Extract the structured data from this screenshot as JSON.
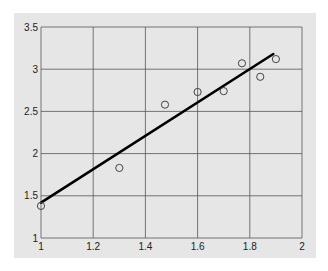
{
  "chart_data": {
    "type": "scatter",
    "title": "",
    "xlabel": "",
    "ylabel": "",
    "xlim": [
      1,
      2
    ],
    "ylim": [
      1,
      3.5
    ],
    "grid": true,
    "legend": null,
    "x_ticks": [
      "1",
      "1.2",
      "1.4",
      "1.6",
      "1.8",
      "2"
    ],
    "y_ticks": [
      "1",
      "1.5",
      "2",
      "2.5",
      "3",
      "3.5"
    ],
    "series": [
      {
        "name": "observations",
        "type": "scatter",
        "marker": "open-circle",
        "points": [
          {
            "x": 1.0,
            "y": 1.38
          },
          {
            "x": 1.3,
            "y": 1.83
          },
          {
            "x": 1.475,
            "y": 2.58
          },
          {
            "x": 1.6,
            "y": 2.73
          },
          {
            "x": 1.7,
            "y": 2.74
          },
          {
            "x": 1.77,
            "y": 3.07
          },
          {
            "x": 1.84,
            "y": 2.91
          },
          {
            "x": 1.9,
            "y": 3.12
          }
        ]
      },
      {
        "name": "fit-line",
        "type": "line",
        "points": [
          {
            "x": 1.0,
            "y": 1.42
          },
          {
            "x": 1.89,
            "y": 3.18
          }
        ]
      }
    ],
    "colors": {
      "panel_background": "#e6e6e6",
      "grid": "#555555",
      "line": "#000000",
      "marker": "#444444"
    }
  }
}
